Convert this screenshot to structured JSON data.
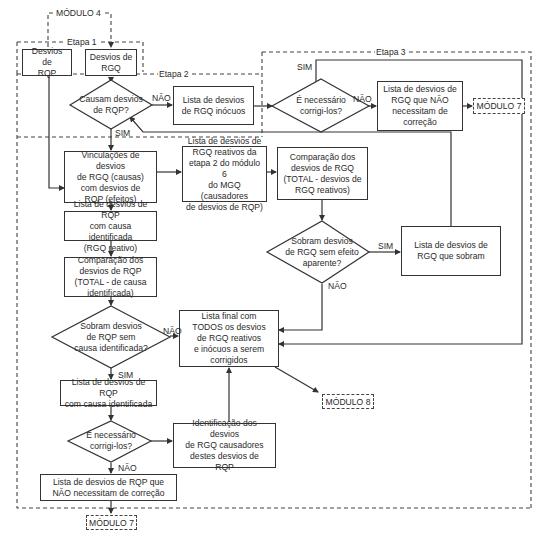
{
  "diagram": {
    "top_module": "MÓDULO 4",
    "stages": {
      "etapa1": "Etapa 1",
      "etapa2": "Etapa 2",
      "etapa3": "Etapa 3"
    },
    "boxes": {
      "desvios_rqp": "Desvios de\nRQP",
      "desvios_rgq": "Desvios de\nRGQ",
      "rgq_inocuos": "Lista de desvios\nde RGQ inócuos",
      "rgq_nao_correcao": "Lista de desvios de\nRGQ que NÃO\nnecessitam de\ncorreção",
      "vinculacoes": "Vinculações de desvios\nde RGQ (causas)\ncom desvios de\nRQP (efeitos)",
      "rgq_reativos": "Lista de desvios de\nRGQ reativos da\netapa 2 do módulo 6\ndo MGQ (causadores\nde desvios de RQP)",
      "comparacao_rgq": "Comparação dos\ndesvios de RGQ\n(TOTAL - desvios de\nRGQ reativos)",
      "rqp_causa_identificada_reativo": "Lista de desvios de RQP\ncom causa identificada\n(RGQ reativo)",
      "rgq_sobram": "Lista de desvios de\nRGQ que sobram",
      "comparacao_rqp": "Comparação dos\ndesvios de RQP\n(TOTAL - de causa\nidentificada)",
      "lista_final": "Lista final com\nTODOS os desvios\nde RGQ reativos\ne inócuos a serem\ncorrigidos",
      "rqp_causa_identificada": "Lista de desvios de RQP\ncom causa identificada",
      "identificacao_rgq": "Identificação dos desvios\nde RGQ causadores\ndestes desvios de\nRQP",
      "rqp_nao_correcao": "Lista de desvios de RQP que\nNÃO necessitam de correção"
    },
    "decisions": {
      "causam_desvios": "Causam desvios\nde RQP?",
      "necessario_rgq": "É necessário\ncorrigi-los?",
      "sobram_rgq": "Sobram desvios\nde RGQ sem efeito\naparente?",
      "sobram_rqp": "Sobram desvios\nde RQP sem\ncausa identificada?",
      "necessario_rqp": "É necessário\ncorrigi-los?"
    },
    "modules": {
      "modulo7_top": "MÓDULO 7",
      "modulo8": "MÓDULO 8",
      "modulo7_bottom": "MÓDULO 7"
    },
    "edge_labels": {
      "yes": "SIM",
      "no": "NÃO"
    },
    "colors": {
      "line": "#333333",
      "dashed": "#444444",
      "background": "#ffffff"
    }
  }
}
